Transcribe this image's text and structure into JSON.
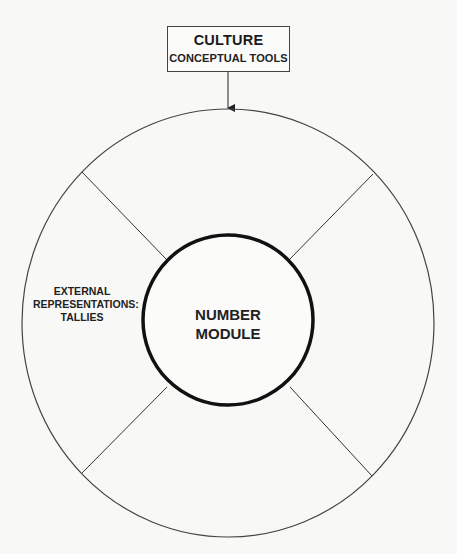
{
  "culture_box": {
    "title": "CULTURE",
    "subtitle": "CONCEPTUAL TOOLS"
  },
  "center": {
    "line1": "NUMBER",
    "line2": "MODULE"
  },
  "segments": {
    "left": {
      "line1": "EXTERNAL",
      "line2": "REPRESENTATIONS:",
      "line3": "TALLIES"
    },
    "top": "",
    "right": "",
    "bottom": ""
  },
  "colors": {
    "background": "#f8f8f6",
    "stroke": "#333333",
    "inner_circle": "#111111"
  }
}
